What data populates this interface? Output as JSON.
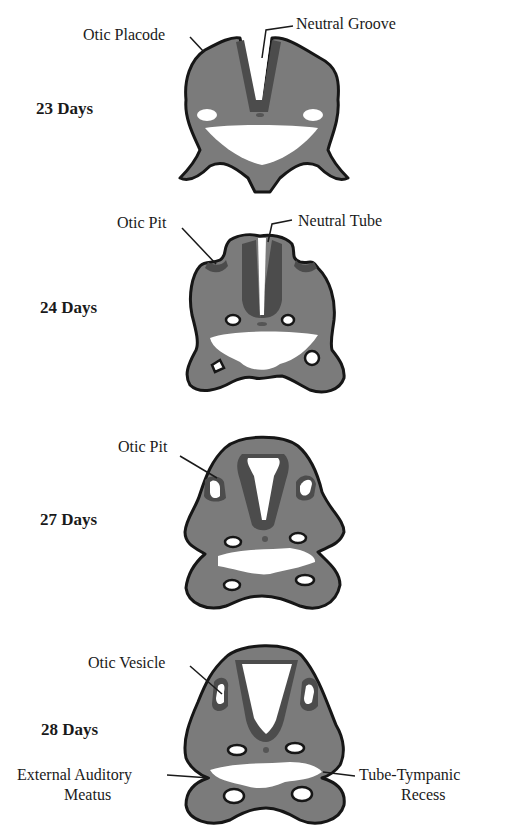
{
  "figure": {
    "stages": [
      {
        "day_label": "23 Days",
        "labels": [
          "Otic Placode",
          "Neutral Groove"
        ]
      },
      {
        "day_label": "24 Days",
        "labels": [
          "Otic Pit",
          "Neutral Tube"
        ]
      },
      {
        "day_label": "27 Days",
        "labels": [
          "Otic Pit"
        ]
      },
      {
        "day_label": "28 Days",
        "labels": [
          "Otic Vesicle",
          "External Auditory",
          "Meatus",
          "Tube-Tympanic",
          "Recess"
        ]
      }
    ],
    "colors": {
      "mesenchyme": "#7b7b7b",
      "neural_tissue": "#4c4c4c",
      "outline": "#161616",
      "background": "#ffffff"
    }
  }
}
